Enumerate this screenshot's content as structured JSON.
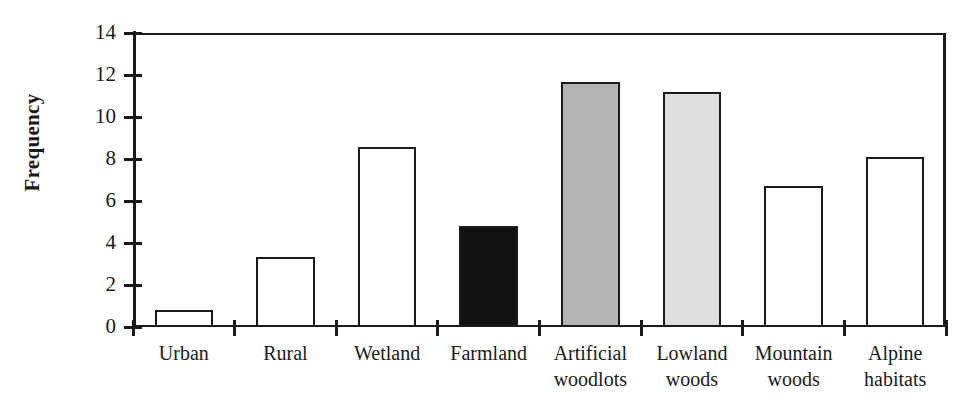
{
  "chart_data": {
    "type": "bar",
    "title": "",
    "xlabel": "",
    "ylabel": "Frequency",
    "ylim": [
      0,
      14
    ],
    "ytick_step": 2,
    "yticks": [
      0,
      2,
      4,
      6,
      8,
      10,
      12,
      14
    ],
    "ytick_labels": [
      "0",
      "2",
      "4",
      "6",
      "8",
      "10",
      "12",
      "14"
    ],
    "grid": false,
    "legend": null,
    "categories": [
      "Urban",
      "Rural",
      "Wetland",
      "Farmland",
      "Artificial woodlots",
      "Lowland woods",
      "Mountain woods",
      "Alpine habitats"
    ],
    "category_label_lines": [
      [
        "Urban"
      ],
      [
        "Rural"
      ],
      [
        "Wetland"
      ],
      [
        "Farmland"
      ],
      [
        "Artificial",
        "woodlots"
      ],
      [
        "Lowland",
        "woods"
      ],
      [
        "Mountain",
        "woods"
      ],
      [
        "Alpine",
        "habitats"
      ]
    ],
    "values": [
      0.8,
      3.35,
      8.55,
      4.8,
      11.65,
      11.2,
      6.7,
      8.1
    ],
    "bar_fills": [
      "#ffffff",
      "#ffffff",
      "#ffffff",
      "#111111",
      "#b4b4b4",
      "#dedede",
      "#ffffff",
      "#ffffff"
    ],
    "bar_edge_color": "#1a1a1a",
    "axis_color": "#1a1a1a",
    "background": "#ffffff"
  }
}
